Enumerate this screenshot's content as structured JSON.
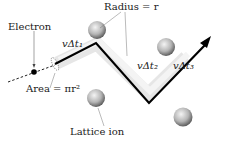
{
  "diagram": {
    "labels": {
      "electron": "Electron",
      "radius": "Radius = r",
      "area": "Area = πr²",
      "lattice_ion": "Lattice ion",
      "seg1": "vΔt₁",
      "seg2": "vΔt₂",
      "seg3": "vΔt₃"
    },
    "colors": {
      "path": "#000000",
      "swept_band": "#e3e3e3",
      "ion_highlight": "#f2f2f2",
      "ion_shadow": "#6a6a6a"
    }
  }
}
